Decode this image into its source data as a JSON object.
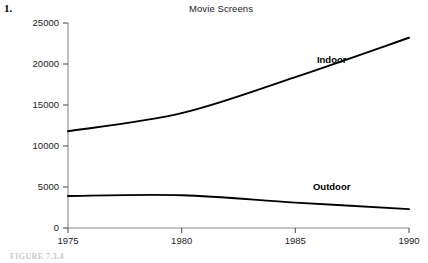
{
  "problem": {
    "number": "1."
  },
  "caption": {
    "text": "FIGURE 7.3.4"
  },
  "labels": {
    "indoor": "Indoor",
    "outdoor": "Outdoor"
  },
  "colors": {
    "line": "#000000",
    "axis": "#8a8a8a",
    "tick": "#555555",
    "text": "#1c1c1c",
    "background": "#ffffff"
  },
  "chart_data": {
    "type": "line",
    "title": "Movie Screens",
    "xlabel": "",
    "ylabel": "",
    "xlim": [
      1975,
      1990
    ],
    "ylim": [
      0,
      25000
    ],
    "grid": false,
    "legend": "inline-annotations",
    "xticks": [
      1975,
      1980,
      1985,
      1990
    ],
    "xtick_labels": [
      "1975",
      "1980",
      "1985",
      "1990"
    ],
    "yticks": [
      0,
      5000,
      10000,
      15000,
      20000,
      25000
    ],
    "ytick_labels": [
      "0",
      "5000",
      "10000",
      "15000",
      "20000",
      "25000"
    ],
    "x": [
      1975,
      1980,
      1985,
      1990
    ],
    "series": [
      {
        "name": "Indoor",
        "values": [
          11800,
          14000,
          18400,
          23200
        ],
        "annotation": "Indoor",
        "annotation_x": 1986.6,
        "annotation_y": 20100
      },
      {
        "name": "Outdoor",
        "values": [
          3900,
          4000,
          3100,
          2300
        ],
        "annotation": "Outdoor",
        "annotation_x": 1986.6,
        "annotation_y": 4600
      }
    ]
  }
}
